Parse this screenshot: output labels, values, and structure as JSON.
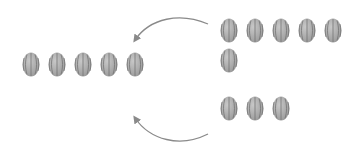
{
  "diagram": {
    "type": "counting-illustration",
    "item_icon": "watermelon-icon",
    "colors": {
      "melon_fill": "#9a9a9a",
      "melon_stripe": "#6e6e6e",
      "melon_highlight": "#c8c8c8",
      "arrow": "#8a8a8a",
      "background": "#ffffff"
    },
    "groups": [
      {
        "name": "left-group",
        "count": 5,
        "items": [
          {
            "x": 22,
            "y": 52
          },
          {
            "x": 48,
            "y": 52
          },
          {
            "x": 74,
            "y": 52
          },
          {
            "x": 100,
            "y": 52
          },
          {
            "x": 126,
            "y": 52
          }
        ]
      },
      {
        "name": "right-top-group",
        "count": 6,
        "items": [
          {
            "x": 220,
            "y": 18
          },
          {
            "x": 246,
            "y": 18
          },
          {
            "x": 272,
            "y": 18
          },
          {
            "x": 298,
            "y": 18
          },
          {
            "x": 324,
            "y": 18
          },
          {
            "x": 220,
            "y": 48
          }
        ]
      },
      {
        "name": "right-bottom-group",
        "count": 3,
        "items": [
          {
            "x": 220,
            "y": 96
          },
          {
            "x": 246,
            "y": 96
          },
          {
            "x": 272,
            "y": 96
          }
        ]
      }
    ],
    "arrows": [
      {
        "name": "top-arrow",
        "from": "right-top-group",
        "to": "left-group",
        "path": "M208,24 C180,12 150,18 135,40",
        "head": [
          135,
          40
        ]
      },
      {
        "name": "bottom-arrow",
        "from": "right-bottom-group",
        "to": "left-group",
        "path": "M208,134 C180,148 150,140 135,118",
        "head": [
          135,
          118
        ]
      }
    ]
  }
}
